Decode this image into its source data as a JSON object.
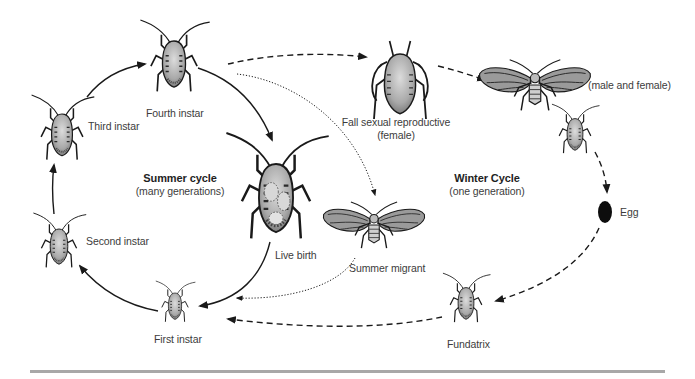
{
  "diagram": {
    "colors": {
      "ink": "#1a1a1a",
      "body_fill": "#b9b9b9",
      "wing_fill": "#9a9a9a",
      "label_text": "#3c3c3c",
      "rule": "#a8a8a8"
    },
    "cycles": {
      "summer": {
        "title": "Summer cycle",
        "subtitle": "(many generations)"
      },
      "winter": {
        "title": "Winter Cycle",
        "subtitle": "(one generation)"
      }
    },
    "stages": [
      {
        "id": "fourth-instar",
        "label": "Fourth instar",
        "cycle": "summer"
      },
      {
        "id": "third-instar",
        "label": "Third instar",
        "cycle": "summer"
      },
      {
        "id": "second-instar",
        "label": "Second instar",
        "cycle": "summer"
      },
      {
        "id": "first-instar",
        "label": "First instar",
        "cycle": "summer"
      },
      {
        "id": "live-birth",
        "label": "Live birth",
        "cycle": "summer"
      },
      {
        "id": "summer-migrant",
        "label": "Summer migrant",
        "cycle": "summer"
      },
      {
        "id": "fall-sexual-reproductive",
        "label": "Fall sexual reproductive",
        "sublabel": "(female)",
        "cycle": "winter"
      },
      {
        "id": "sexuals",
        "label": "(male and female)",
        "cycle": "winter"
      },
      {
        "id": "egg",
        "label": "Egg",
        "cycle": "winter"
      },
      {
        "id": "fundatrix",
        "label": "Fundatrix",
        "cycle": "winter"
      }
    ],
    "arrows": [
      {
        "from": "third-instar",
        "to": "fourth-instar",
        "style": "solid"
      },
      {
        "from": "fourth-instar",
        "to": "live-birth",
        "style": "solid"
      },
      {
        "from": "live-birth",
        "to": "first-instar",
        "style": "solid"
      },
      {
        "from": "first-instar",
        "to": "second-instar",
        "style": "solid"
      },
      {
        "from": "second-instar",
        "to": "third-instar",
        "style": "solid"
      },
      {
        "from": "fourth-instar",
        "to": "fall-sexual-reproductive",
        "style": "dashed"
      },
      {
        "from": "fall-sexual-reproductive",
        "to": "sexuals",
        "style": "dashed"
      },
      {
        "from": "sexuals",
        "to": "egg",
        "style": "dashed"
      },
      {
        "from": "egg",
        "to": "fundatrix",
        "style": "dashed"
      },
      {
        "from": "fundatrix",
        "to": "first-instar",
        "style": "dashed"
      },
      {
        "from": "fourth-instar",
        "to": "summer-migrant",
        "style": "dotted"
      },
      {
        "from": "summer-migrant",
        "to": "first-instar",
        "style": "dotted"
      }
    ]
  }
}
